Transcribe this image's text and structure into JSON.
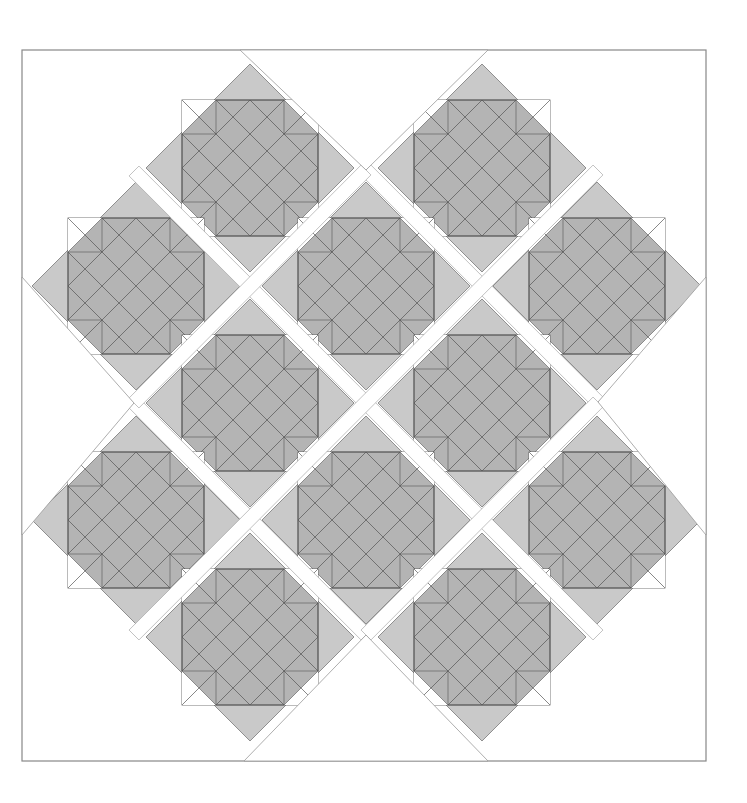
{
  "diagram": {
    "type": "quilt-block-layout",
    "layout": "on-point blocks with white sashing strips",
    "colors": {
      "background": "#ffffff",
      "block_outer": "#c9c9c9",
      "block_cross": "#b4b4b4",
      "notch": "#ffffff",
      "sashing": "#ffffff",
      "line": "#555555",
      "border": "#888888"
    },
    "border_rect": {
      "x": 22,
      "y": 50,
      "width": 684,
      "height": 711
    },
    "block_geometry": {
      "diamond_half_diagonal": 104,
      "cross_outer_half": 68,
      "cross_inner_half": 34
    },
    "block_count": 12,
    "blocks": [
      {
        "row": 1,
        "cx": 250,
        "cy": 168
      },
      {
        "row": 1,
        "cx": 482,
        "cy": 168
      },
      {
        "row": 2,
        "cx": 136,
        "cy": 286
      },
      {
        "row": 2,
        "cx": 366,
        "cy": 286
      },
      {
        "row": 2,
        "cx": 597,
        "cy": 286
      },
      {
        "row": 3,
        "cx": 250,
        "cy": 403
      },
      {
        "row": 3,
        "cx": 482,
        "cy": 403
      },
      {
        "row": 4,
        "cx": 136,
        "cy": 520
      },
      {
        "row": 4,
        "cx": 366,
        "cy": 520
      },
      {
        "row": 4,
        "cx": 597,
        "cy": 520
      },
      {
        "row": 5,
        "cx": 250,
        "cy": 637
      },
      {
        "row": 5,
        "cx": 482,
        "cy": 637
      }
    ],
    "sashing_width": 14,
    "sashing_strips": [
      {
        "x1": 134,
        "y1": 171,
        "x2": 598,
        "y2": 635
      },
      {
        "x1": 366,
        "y1": 170,
        "x2": 598,
        "y2": 402
      },
      {
        "x1": 134,
        "y1": 403,
        "x2": 366,
        "y2": 635
      },
      {
        "x1": 366,
        "y1": 170,
        "x2": 134,
        "y2": 403
      },
      {
        "x1": 598,
        "y1": 170,
        "x2": 134,
        "y2": 635
      },
      {
        "x1": 598,
        "y1": 402,
        "x2": 366,
        "y2": 635
      }
    ],
    "edge_triangles": [
      {
        "name": "top",
        "points": [
          [
            240,
            50
          ],
          [
            488,
            50
          ],
          [
            366,
            170
          ]
        ]
      },
      {
        "name": "bottom",
        "points": [
          [
            244,
            761
          ],
          [
            488,
            761
          ],
          [
            366,
            635
          ]
        ]
      },
      {
        "name": "left",
        "points": [
          [
            22,
            277
          ],
          [
            22,
            535
          ],
          [
            134,
            403
          ]
        ]
      },
      {
        "name": "right",
        "points": [
          [
            706,
            277
          ],
          [
            706,
            535
          ],
          [
            598,
            402
          ]
        ]
      }
    ]
  }
}
